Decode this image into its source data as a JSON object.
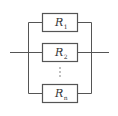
{
  "diagram": {
    "type": "parallel-resistor-circuit",
    "resistors": [
      {
        "symbol": "R",
        "subscript": "1"
      },
      {
        "symbol": "R",
        "subscript": "2"
      },
      {
        "symbol": "R",
        "subscript": "n"
      }
    ],
    "ellipsis": "⋮",
    "colors": {
      "line": "#555555",
      "text": "#333333",
      "background": "#ffffff"
    }
  }
}
